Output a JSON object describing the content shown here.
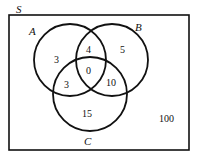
{
  "diagram": {
    "type": "venn",
    "universe_label": "S",
    "sets": [
      {
        "name": "A"
      },
      {
        "name": "B"
      },
      {
        "name": "C"
      }
    ],
    "regions": {
      "A_only": "3",
      "B_only": "5",
      "C_only": "15",
      "A_and_B_only": "4",
      "A_and_C_only": "3",
      "B_and_C_only": "10",
      "A_and_B_and_C": "0",
      "outside": "100"
    },
    "colors": {
      "stroke": "#111111",
      "background": "#ffffff"
    }
  }
}
